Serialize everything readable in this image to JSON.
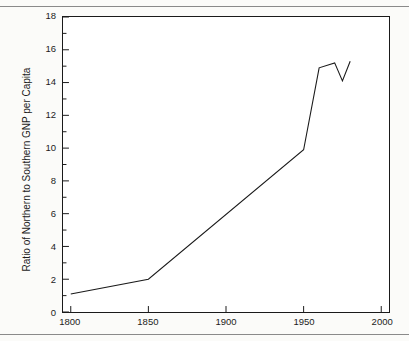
{
  "figure": {
    "background_color": "#fbfbf9",
    "plot_background_color": "#ffffff",
    "frame_color": "#1a1a1a",
    "line_color": "#1a1a1a"
  },
  "chart_data": {
    "type": "line",
    "title": "",
    "xlabel": "",
    "ylabel": "Ratio of Northern to Southern GNP per Capita",
    "xlim": [
      1795,
      2005
    ],
    "ylim": [
      0,
      18
    ],
    "grid": false,
    "legend": false,
    "xticks": [
      1800,
      1850,
      1900,
      1950,
      2000
    ],
    "xticklabels": [
      "1800",
      "1850",
      "1900",
      "1950",
      "2000"
    ],
    "yticks": [
      0,
      2,
      4,
      6,
      8,
      10,
      12,
      14,
      16,
      18
    ],
    "yticklabels": [
      "0",
      "2",
      "4",
      "6",
      "8",
      "10",
      "12",
      "14",
      "16",
      "18"
    ],
    "yminorticks": [
      1,
      3,
      5,
      7,
      9,
      11,
      13,
      15,
      17
    ],
    "series": [
      {
        "name": "Ratio of Northern to Southern GNP per Capita",
        "x": [
          1800,
          1850,
          1950,
          1960,
          1970,
          1975,
          1980
        ],
        "values": [
          1.1,
          2.0,
          9.9,
          14.9,
          15.2,
          14.1,
          15.3
        ]
      }
    ]
  }
}
